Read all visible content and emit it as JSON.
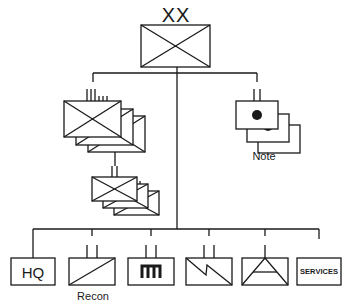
{
  "diagram": {
    "type": "military-organization-chart",
    "top_unit": {
      "echelon_label": "XX",
      "symbol": "infantry",
      "echelon": "division"
    },
    "branches": [
      {
        "name": "regiment-group",
        "echelon_marks": "III / I",
        "symbol": "infantry",
        "stacked": 3
      },
      {
        "name": "battalion-group",
        "echelon_marks": "II",
        "symbol": "infantry",
        "stacked": 3
      },
      {
        "name": "artillery-group",
        "echelon_marks": "II",
        "symbol": "artillery",
        "stacked": 3,
        "label": "Note"
      }
    ],
    "support_units": [
      {
        "id": "hq",
        "text": "HQ",
        "label": ""
      },
      {
        "id": "recon",
        "text": "",
        "label": "Recon",
        "symbol": "cavalry-diagonal"
      },
      {
        "id": "armor",
        "text": "m",
        "label": "",
        "symbol": "tank-glyph"
      },
      {
        "id": "signal",
        "text": "",
        "label": "",
        "symbol": "signal-zigzag"
      },
      {
        "id": "engineer",
        "text": "",
        "label": "",
        "symbol": "air-defense-triangle"
      },
      {
        "id": "services",
        "text": "SERVICES",
        "label": ""
      }
    ]
  },
  "labels": {
    "top_echelon": "XX",
    "note": "Note",
    "recon": "Recon",
    "hq": "HQ",
    "services": "SERVICES"
  },
  "colors": {
    "line": "#1a1a1a",
    "background": "#ffffff"
  }
}
